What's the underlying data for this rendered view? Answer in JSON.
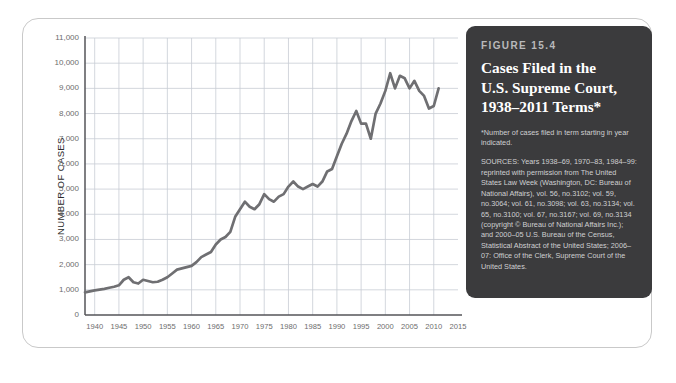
{
  "caption": {
    "figure_number": "FIGURE 15.4",
    "title_lines": [
      "Cases Filed in the",
      "U.S. Supreme Court,",
      "1938–2011 Terms*"
    ],
    "footnote": "*Number of cases filed in term starting in year indicated.",
    "sources_label": "SOURCES:",
    "sources_text": "Years 1938–69, 1970–83, 1984–99: reprinted with permission from The United States Law Week (Washington, DC: Bureau of National Affairs), vol. 56, no.3102; vol. 59, no.3064; vol. 61, no.3098; vol. 63, no.3134; vol. 65, no.3100; vol. 67, no.3167; vol. 69, no.3134 (copyright © Bureau of National Affairs Inc.); and 2000–05 U.S. Bureau of the Census, Statistical Abstract of the United States; 2006–07: Office of the Clerk, Supreme Court of the United States."
  },
  "colors": {
    "card_background": "#3b3b3d",
    "line": "#6f6f72",
    "gridline": "#c8cdd4",
    "axis": "#555558",
    "frame": "#c9c9c9",
    "tick_text": "#6d6d6d"
  },
  "chart_data": {
    "type": "line",
    "title": "Cases Filed in the U.S. Supreme Court, 1938–2011 Terms",
    "xlabel": "",
    "ylabel": "NUMBER OF CASES",
    "xlim": [
      1938,
      2015
    ],
    "ylim": [
      0,
      11000
    ],
    "ytick_labels": [
      "0",
      "1,000",
      "2,000",
      "3,000",
      "4,000",
      "5,000",
      "6,000",
      "7,000",
      "8,000",
      "9,000",
      "10,000",
      "11,000"
    ],
    "ytick_values": [
      0,
      1000,
      2000,
      3000,
      4000,
      5000,
      6000,
      7000,
      8000,
      9000,
      10000,
      11000
    ],
    "xtick_labels": [
      "1940",
      "1945",
      "1950",
      "1955",
      "1960",
      "1965",
      "1970",
      "1975",
      "1980",
      "1985",
      "1990",
      "1995",
      "2000",
      "2005",
      "2010",
      "2015"
    ],
    "xtick_values": [
      1940,
      1945,
      1950,
      1955,
      1960,
      1965,
      1970,
      1975,
      1980,
      1985,
      1990,
      1995,
      2000,
      2005,
      2010,
      2015
    ],
    "grid": true,
    "legend": "none",
    "series": [
      {
        "name": "Cases filed",
        "x": [
          1938,
          1939,
          1940,
          1941,
          1942,
          1943,
          1944,
          1945,
          1946,
          1947,
          1948,
          1949,
          1950,
          1951,
          1952,
          1953,
          1954,
          1955,
          1956,
          1957,
          1958,
          1959,
          1960,
          1961,
          1962,
          1963,
          1964,
          1965,
          1966,
          1967,
          1968,
          1969,
          1970,
          1971,
          1972,
          1973,
          1974,
          1975,
          1976,
          1977,
          1978,
          1979,
          1980,
          1981,
          1982,
          1983,
          1984,
          1985,
          1986,
          1987,
          1988,
          1989,
          1990,
          1991,
          1992,
          1993,
          1994,
          1995,
          1996,
          1997,
          1998,
          1999,
          2000,
          2001,
          2002,
          2003,
          2004,
          2005,
          2006,
          2007,
          2008,
          2009,
          2010,
          2011
        ],
        "values": [
          900,
          940,
          980,
          1010,
          1040,
          1080,
          1120,
          1180,
          1400,
          1500,
          1300,
          1250,
          1400,
          1350,
          1300,
          1320,
          1400,
          1500,
          1650,
          1800,
          1850,
          1900,
          1950,
          2100,
          2300,
          2400,
          2500,
          2800,
          3000,
          3100,
          3300,
          3900,
          4200,
          4500,
          4300,
          4200,
          4400,
          4800,
          4600,
          4500,
          4700,
          4800,
          5100,
          5300,
          5100,
          5000,
          5100,
          5200,
          5100,
          5300,
          5700,
          5800,
          6300,
          6800,
          7200,
          7700,
          8100,
          7600,
          7600,
          7000,
          8000,
          8400,
          8900,
          9600,
          9000,
          9500,
          9400,
          9000,
          9300,
          8900,
          8700,
          8200,
          8300,
          9000
        ],
        "color": "#6f6f72"
      }
    ]
  }
}
